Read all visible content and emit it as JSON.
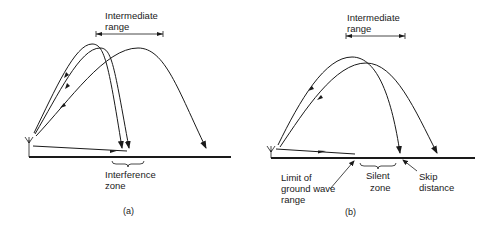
{
  "panels": [
    {
      "id": "a",
      "caption": "(a)",
      "labels": {
        "intermediate_line1": "Intermediate",
        "intermediate_line2": "range",
        "zone_line1": "Interference",
        "zone_line2": "zone"
      },
      "elements": [
        "transmitting-antenna",
        "ground-surface",
        "ground-wave",
        "sky-wave-1",
        "sky-wave-2",
        "sky-wave-3",
        "intermediate-range-bracket",
        "interference-zone-brace"
      ]
    },
    {
      "id": "b",
      "caption": "(b)",
      "labels": {
        "intermediate_line1": "Intermediate",
        "intermediate_line2": "range",
        "zone_line1": "Silent",
        "zone_line2": "zone",
        "limit_line1": "Limit of",
        "limit_line2": "ground wave",
        "limit_line3": "range",
        "skip_line1": "Skip",
        "skip_line2": "distance"
      },
      "elements": [
        "transmitting-antenna",
        "ground-surface",
        "ground-wave",
        "sky-wave-1",
        "sky-wave-2",
        "intermediate-range-bracket",
        "silent-zone-brace",
        "limit-pointer",
        "skip-pointer"
      ]
    }
  ],
  "colors": {
    "ink": "#1a1a1a",
    "background": "#ffffff"
  }
}
